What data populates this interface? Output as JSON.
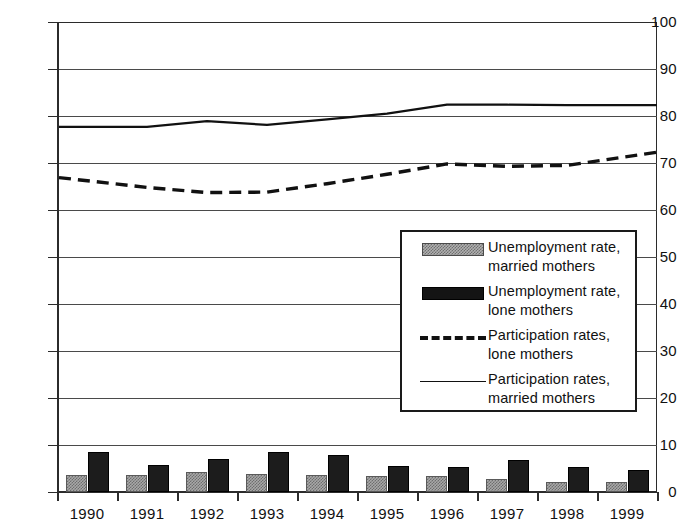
{
  "chart_data": {
    "type": "bar",
    "title": "",
    "subtitle": "",
    "xlabel": "",
    "ylabel": "",
    "ylim": [
      0,
      100
    ],
    "y_ticks": [
      0,
      10,
      20,
      30,
      40,
      50,
      60,
      70,
      80,
      90,
      100
    ],
    "grid": true,
    "legend_position": "center-right-inside",
    "categories": [
      "1990",
      "1991",
      "1992",
      "1993",
      "1994",
      "1995",
      "1996",
      "1997",
      "1998",
      "1999"
    ],
    "series": [
      {
        "name": "Unemployment rate, married mothers",
        "type": "bar",
        "style": "hatched-grey",
        "color": "#a8a8a8",
        "values": [
          3.7,
          3.6,
          4.2,
          3.8,
          3.6,
          3.5,
          3.5,
          2.8,
          2.2,
          2.1
        ]
      },
      {
        "name": "Unemployment rate, lone mothers",
        "type": "bar",
        "style": "solid-black",
        "color": "#1c1c1c",
        "values": [
          8.5,
          5.7,
          7.0,
          8.5,
          7.8,
          5.5,
          5.3,
          6.8,
          5.3,
          4.7
        ]
      },
      {
        "name": "Participation rates, lone mothers",
        "type": "line",
        "style": "dashed",
        "color": "#111111",
        "values": [
          66.9,
          64.8,
          63.7,
          63.8,
          65.6,
          67.6,
          69.8,
          69.3,
          69.5,
          72.3
        ]
      },
      {
        "name": "Participation rates, married mothers",
        "type": "line",
        "style": "solid",
        "color": "#111111",
        "values": [
          77.7,
          77.7,
          78.9,
          78.1,
          79.3,
          80.5,
          82.4,
          82.4,
          82.3,
          82.3
        ]
      }
    ]
  },
  "axis": {
    "y_tick_labels": [
      "100",
      "90",
      "80",
      "70",
      "60",
      "50",
      "40",
      "30",
      "20",
      "10",
      "0"
    ],
    "x_tick_labels": [
      "1990",
      "1991",
      "1992",
      "1993",
      "1994",
      "1995",
      "1996",
      "1997",
      "1998",
      "1999"
    ]
  },
  "legend": {
    "entries": [
      {
        "key": "hatched-grey-swatch",
        "line1": "Unemployment rate,",
        "line2": "married mothers"
      },
      {
        "key": "black-swatch",
        "line1": "Unemployment rate,",
        "line2": "lone mothers"
      },
      {
        "key": "dashed-line",
        "line1": "Participation rates,",
        "line2": "lone mothers"
      },
      {
        "key": "solid-line",
        "line1": "Participation rates,",
        "line2": "married mothers"
      }
    ]
  }
}
